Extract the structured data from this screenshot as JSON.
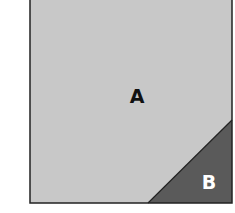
{
  "regions": [
    {
      "id": "A",
      "label": "A",
      "fill": "#c8c8c8",
      "text_color": "#111111"
    },
    {
      "id": "B",
      "label": "B",
      "fill": "#5a5a5a",
      "text_color": "#ffffff"
    }
  ],
  "colors": {
    "border": "#222222",
    "background": "#ffffff"
  }
}
